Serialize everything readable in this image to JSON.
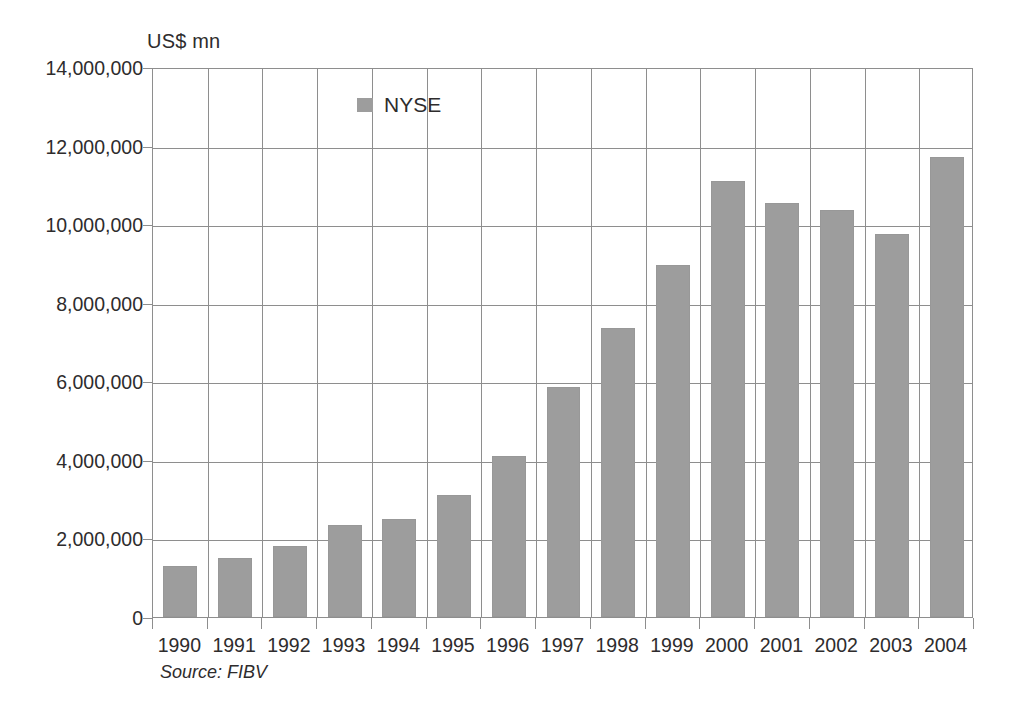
{
  "figure": {
    "unit_label": "US$ mn",
    "source_note": "Source: FIBV",
    "legend_label": "NYSE",
    "bar_color": "#9d9d9d",
    "axis_color": "#8e8e8e",
    "text_color": "#2e2c2d",
    "background": "#ffffff"
  },
  "chart_data": {
    "type": "bar",
    "title": "",
    "subtitle": "",
    "xlabel": "",
    "ylabel": "US$ mn",
    "ylim": [
      0,
      14000000
    ],
    "ytick_step": 2000000,
    "ytick_labels": [
      "14,000,000",
      "12,000,000",
      "10,000,000",
      "8,000,000",
      "6,000,000",
      "4,000,000",
      "2,000,000",
      "0"
    ],
    "ytick_values": [
      14000000,
      12000000,
      10000000,
      8000000,
      6000000,
      4000000,
      2000000,
      0
    ],
    "grid": true,
    "grid_axes": "both",
    "legend_position": "inside-top-left",
    "categories": [
      "1990",
      "1991",
      "1992",
      "1993",
      "1994",
      "1995",
      "1996",
      "1997",
      "1998",
      "1999",
      "2000",
      "2001",
      "2002",
      "2003",
      "2004"
    ],
    "series": [
      {
        "name": "NYSE",
        "color": "#9d9d9d",
        "values": [
          1300000,
          1500000,
          1800000,
          2350000,
          2500000,
          3100000,
          4100000,
          5850000,
          7350000,
          8950000,
          11100000,
          10550000,
          10350000,
          9750000,
          11700000
        ]
      }
    ],
    "annotations": [
      "US$ mn",
      "Source: FIBV"
    ]
  }
}
